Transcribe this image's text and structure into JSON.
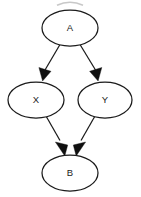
{
  "diagram": {
    "type": "directed-acyclic-graph",
    "title": "",
    "background_color": "#ffffff",
    "stroke_color": "#1b1b1b",
    "node_fill_color": "#ffffff",
    "arrowhead_color": "#101010",
    "nodes": [
      {
        "id": "A",
        "label": "A",
        "cx": 70,
        "cy": 28,
        "rx": 28,
        "ry": 18
      },
      {
        "id": "X",
        "label": "X",
        "cx": 36,
        "cy": 100,
        "rx": 28,
        "ry": 18
      },
      {
        "id": "Y",
        "label": "Y",
        "cx": 105,
        "cy": 100,
        "rx": 27,
        "ry": 18
      },
      {
        "id": "B",
        "label": "B",
        "cx": 70,
        "cy": 173,
        "rx": 28,
        "ry": 18
      }
    ],
    "edges": [
      {
        "id": "A-X",
        "from": "A",
        "to": "X",
        "directed": true
      },
      {
        "id": "A-Y",
        "from": "A",
        "to": "Y",
        "directed": true
      },
      {
        "id": "X-B",
        "from": "X",
        "to": "B",
        "directed": true
      },
      {
        "id": "Y-B",
        "from": "Y",
        "to": "B",
        "directed": true
      }
    ],
    "artifact": {
      "name": "cropped-arc-top-edge",
      "color": "#9a9a9a",
      "description": "faint partial arc clipped at the top border"
    }
  }
}
